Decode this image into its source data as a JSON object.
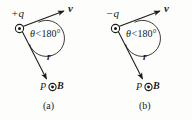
{
  "figure": {
    "background_color": "#fdfdfc",
    "ink_color": "#1a1a1a",
    "panels": [
      {
        "id": "a",
        "caption": "(a)",
        "charge_label": "+q",
        "charge_marker": "circle-dot-origin",
        "velocity_label": "v",
        "radius_label": "r",
        "angle_label": {
          "symbol": "θ",
          "relation": "<",
          "value": "180°",
          "full": "θ<180°"
        },
        "field_point_label": "P",
        "field_label": "B",
        "field_marker": "circle-dot-out-of-page"
      },
      {
        "id": "b",
        "caption": "(b)",
        "charge_label": "−q",
        "charge_marker": "circle-dot-origin",
        "velocity_label": "v",
        "radius_label": "r",
        "angle_label": {
          "symbol": "θ",
          "relation": "<",
          "value": "180°",
          "full": "θ<180°"
        },
        "field_point_label": "P",
        "field_label": "B",
        "field_marker": "circle-dot-out-of-page"
      }
    ]
  }
}
